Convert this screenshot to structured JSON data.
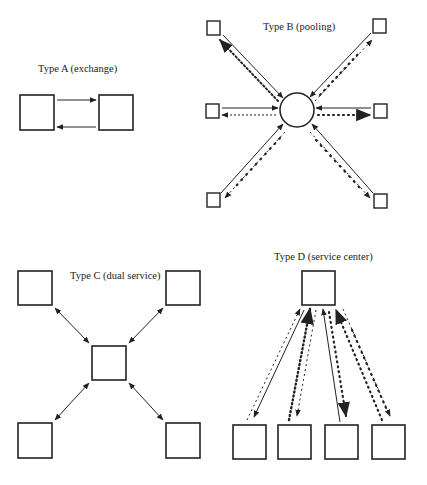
{
  "panels": {
    "a": {
      "title": "Type A (exchange)"
    },
    "b": {
      "title": "Type B (pooling)"
    },
    "c": {
      "title": "Type C (dual service)"
    },
    "d": {
      "title": "Type D (service center)"
    }
  },
  "colors": {
    "stroke": "#222222",
    "background": "#ffffff"
  }
}
